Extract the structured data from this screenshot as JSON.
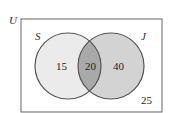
{
  "diagram": {
    "type": "venn",
    "universe": {
      "label": "U",
      "outside_count": "25"
    },
    "sets": [
      {
        "label": "S",
        "only_count": "15",
        "fill": "#ebebeb"
      },
      {
        "label": "J",
        "only_count": "40",
        "fill": "#d3d3d3"
      }
    ],
    "intersection": {
      "count": "20",
      "fill": "#a9a9a9"
    },
    "colors": {
      "outline": "#555555",
      "border": "#666666",
      "background": "#ffffff"
    }
  }
}
